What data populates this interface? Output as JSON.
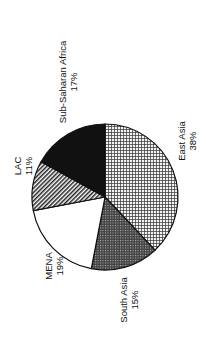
{
  "chart_data": {
    "type": "pie",
    "title": "",
    "orientation": "rotated-90-ccw",
    "categories": [
      "East Asia",
      "South Asia",
      "MENA",
      "LAC",
      "Sub-Saharan Africa"
    ],
    "values": [
      38,
      15,
      19,
      11,
      17
    ],
    "unit": "%",
    "slices": [
      {
        "label": "East Asia",
        "value": 38,
        "value_label": "38%",
        "fill": "fine-grid"
      },
      {
        "label": "South Asia",
        "value": 15,
        "value_label": "15%",
        "fill": "dark-crosshatch"
      },
      {
        "label": "MENA",
        "value": 19,
        "value_label": "19%",
        "fill": "white"
      },
      {
        "label": "LAC",
        "value": 11,
        "value_label": "11%",
        "fill": "diagonal-hatch"
      },
      {
        "label": "Sub-Saharan Africa",
        "value": 17,
        "value_label": "17%",
        "fill": "solid-black"
      }
    ],
    "legend": "none (direct labels)",
    "colors": {
      "ink": "#111111",
      "background": "#ffffff",
      "grid_fill": "#e8e8e8",
      "crosshatch_fill": "#555555"
    }
  }
}
